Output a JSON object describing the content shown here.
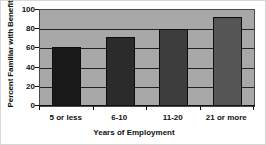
{
  "chart_data": {
    "type": "bar",
    "title": "",
    "categories": [
      "5 or less",
      "6-10",
      "11-20",
      "21 or more"
    ],
    "values": [
      61,
      72,
      80,
      93
    ],
    "xlabel": "Years of Employment",
    "ylabel": "Percent Familiar with Benefit",
    "ylim": [
      0,
      100
    ],
    "yticks": [
      0,
      20,
      40,
      60,
      80,
      100
    ],
    "ytick_labels": [
      "0",
      "20",
      "40",
      "60",
      "80",
      "100"
    ],
    "grid": true,
    "legend": false,
    "bar_colors": [
      "#1a1a1a",
      "#2b2b2b",
      "#3d3d3d",
      "#565656"
    ],
    "plot_background": "#a8a8a8",
    "figure_background": "#ffffff",
    "axis_color": "#111111",
    "gridline_color": "#232323"
  }
}
